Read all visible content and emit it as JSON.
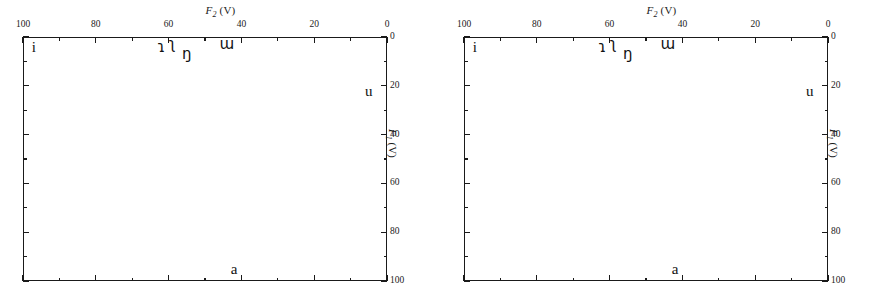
{
  "figure": {
    "panels": [
      {
        "id": "panel-left",
        "axis_title_x": "F2 (V)",
        "axis_title_y": "F1 (V)"
      },
      {
        "id": "panel-right",
        "axis_title_x": "F2 (V)",
        "axis_title_y": "F1 (V)"
      }
    ]
  },
  "axis_text": {
    "x_var": "F",
    "x_sub": "2",
    "x_unit": " (V)",
    "y_var": "F",
    "y_sub": "1",
    "y_unit": " (V)"
  },
  "chart_data": {
    "type": "scatter",
    "title": "",
    "subtitle": "",
    "xlabel": "F2 (V)",
    "ylabel": "F1 (V)",
    "xlim": [
      100,
      0
    ],
    "ylim": [
      0,
      100
    ],
    "x_axis_position": "top",
    "y_axis_position": "right",
    "x_reversed": true,
    "y_reversed": true,
    "grid": false,
    "legend": null,
    "x_major_ticks": [
      100,
      80,
      60,
      40,
      20,
      0
    ],
    "x_minor_ticks": [
      90,
      70,
      50,
      30,
      10
    ],
    "x_tick_labels": [
      "100",
      "80",
      "60",
      "40",
      "20",
      "0"
    ],
    "y_major_ticks": [
      0,
      20,
      40,
      60,
      80,
      100
    ],
    "y_minor_ticks": [
      10,
      30,
      50,
      70,
      90
    ],
    "y_tick_labels": [
      "0",
      "20",
      "40",
      "60",
      "80",
      "100"
    ],
    "point_label_field": "label",
    "panels": [
      {
        "name": "left",
        "points": [
          {
            "label": "i",
            "x": 97,
            "y": 4
          },
          {
            "label": "ɿ",
            "x": 62,
            "y": 4
          },
          {
            "label": "ʅ",
            "x": 59,
            "y": 3
          },
          {
            "label": "ŋ",
            "x": 55,
            "y": 7
          },
          {
            "label": "ɯ",
            "x": 44,
            "y": 3
          },
          {
            "label": "u",
            "x": 5,
            "y": 22
          },
          {
            "label": "a",
            "x": 42,
            "y": 95
          }
        ]
      },
      {
        "name": "right",
        "points": [
          {
            "label": "i",
            "x": 97,
            "y": 4
          },
          {
            "label": "ɿ",
            "x": 62,
            "y": 4
          },
          {
            "label": "ʅ",
            "x": 59,
            "y": 3
          },
          {
            "label": "ŋ",
            "x": 55,
            "y": 7
          },
          {
            "label": "ɯ",
            "x": 44,
            "y": 3
          },
          {
            "label": "u",
            "x": 5,
            "y": 22
          },
          {
            "label": "a",
            "x": 42,
            "y": 95
          }
        ]
      }
    ]
  },
  "colors": {
    "ink": "#1a1a1a",
    "background": "#ffffff"
  }
}
